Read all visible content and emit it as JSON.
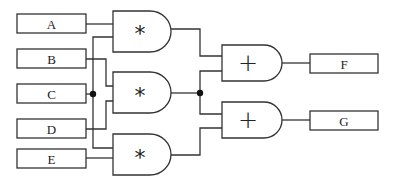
{
  "diagram": {
    "type": "logic-circuit",
    "colors": {
      "stroke": "#333333",
      "junction": "#111111",
      "background": "#ffffff"
    },
    "inputs": [
      {
        "id": "A",
        "label": "A"
      },
      {
        "id": "B",
        "label": "B"
      },
      {
        "id": "C",
        "label": "C"
      },
      {
        "id": "D",
        "label": "D"
      },
      {
        "id": "E",
        "label": "E"
      }
    ],
    "gates": [
      {
        "id": "g1",
        "symbol": "*",
        "inputs": [
          "A",
          "C"
        ]
      },
      {
        "id": "g2",
        "symbol": "*",
        "inputs": [
          "B",
          "D"
        ]
      },
      {
        "id": "g3",
        "symbol": "*",
        "inputs": [
          "C",
          "E"
        ]
      },
      {
        "id": "g4",
        "symbol": "+",
        "inputs": [
          "g1",
          "g2"
        ]
      },
      {
        "id": "g5",
        "symbol": "+",
        "inputs": [
          "g2",
          "g3"
        ]
      }
    ],
    "outputs": [
      {
        "id": "F",
        "label": "F",
        "from": "g4"
      },
      {
        "id": "G",
        "label": "G",
        "from": "g5"
      }
    ],
    "junctions": [
      {
        "id": "j1",
        "on": "C"
      },
      {
        "id": "j2",
        "on": "g2"
      }
    ]
  }
}
